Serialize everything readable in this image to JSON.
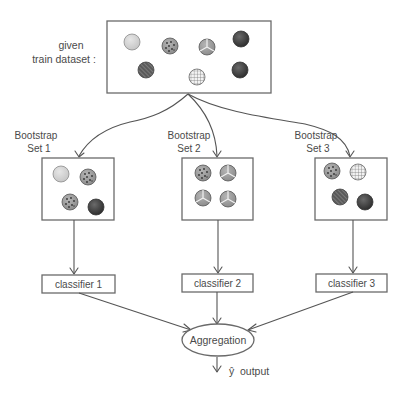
{
  "diagram": {
    "dataset": {
      "label_line1": "given",
      "label_line2": "train dataset :",
      "samples": [
        {
          "id": "light",
          "pattern": "solid-light"
        },
        {
          "id": "dotted",
          "pattern": "dotted"
        },
        {
          "id": "tri",
          "pattern": "tri-segment"
        },
        {
          "id": "dark1",
          "pattern": "solid-dark"
        },
        {
          "id": "striped",
          "pattern": "diagonal-stripes"
        },
        {
          "id": "grid",
          "pattern": "grid"
        },
        {
          "id": "dark2",
          "pattern": "solid-dark"
        }
      ]
    },
    "bootstrap_sets": [
      {
        "label_line1": "Bootstrap",
        "label_line2": "Set 1",
        "samples": [
          "solid-light",
          "dotted",
          "dotted",
          "solid-dark"
        ]
      },
      {
        "label_line1": "Bootstrap",
        "label_line2": "Set 2",
        "samples": [
          "dotted",
          "tri-segment",
          "tri-segment",
          "tri-segment"
        ]
      },
      {
        "label_line1": "Bootstrap",
        "label_line2": "Set 3",
        "samples": [
          "dotted",
          "grid",
          "diagonal-stripes",
          "solid-dark"
        ]
      }
    ],
    "classifiers": [
      {
        "label": "classifier 1"
      },
      {
        "label": "classifier 2"
      },
      {
        "label": "classifier 3"
      }
    ],
    "aggregation": {
      "label": "Aggregation"
    },
    "output": {
      "symbol": "ŷ",
      "label": "output"
    },
    "colors": {
      "line": "#555555",
      "box_border": "#6a6a6a",
      "text": "#4a4a4a",
      "light_fill": "#d8d8d8",
      "mid_fill": "#9a9a9a",
      "dark_fill": "#3c3c3c"
    }
  }
}
